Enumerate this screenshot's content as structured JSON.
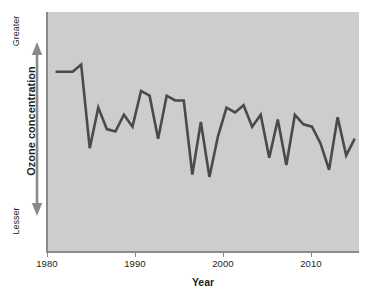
{
  "chart_data": {
    "type": "line",
    "title": "",
    "xlabel": "Year",
    "ylabel": "Ozone concentration",
    "y_axis_top_label": "Greater",
    "y_axis_bottom_label": "Lesser",
    "y_axis_tick_labels": [],
    "y_axis_has_numeric_ticks": false,
    "grid": false,
    "legend": null,
    "legend_position": "none",
    "xlim": [
      1979,
      2015.5
    ],
    "ylim": [
      0,
      100
    ],
    "x_tick_labels": [
      "1980",
      "1990",
      "2000",
      "2010"
    ],
    "x_ticks": [
      1980,
      1990,
      2000,
      2010
    ],
    "series": [
      {
        "name": "Ozone concentration",
        "x": [
          1980,
          1981,
          1982,
          1983,
          1984,
          1985,
          1986,
          1987,
          1988,
          1989,
          1990,
          1991,
          1992,
          1993,
          1994,
          1995,
          1996,
          1997,
          1998,
          1999,
          2000,
          2001,
          2002,
          2003,
          2004,
          2005,
          2006,
          2007,
          2008,
          2009,
          2010,
          2011,
          2012,
          2013,
          2014,
          2015
        ],
        "values": [
          75,
          75,
          75,
          78,
          43,
          60,
          51,
          50,
          57,
          52,
          67,
          65,
          47,
          65,
          63,
          63,
          32,
          54,
          31,
          48,
          60,
          58,
          61,
          52,
          57,
          39,
          55,
          36,
          57,
          53,
          52,
          45,
          34,
          56,
          40,
          47
        ]
      }
    ],
    "annotations": [],
    "colors": {
      "line": "#4a4a4a",
      "plot_background": "#cdcdcd",
      "figure_background": "#ffffff",
      "axis": "#8a8a8a",
      "text": "#231f20"
    }
  },
  "axes": {
    "x": {
      "title": "Year",
      "ticks": [
        {
          "label": "1980",
          "value": 1980
        },
        {
          "label": "1990",
          "value": 1990
        },
        {
          "label": "2000",
          "value": 2000
        },
        {
          "label": "2010",
          "value": 2010
        }
      ]
    },
    "y": {
      "title": "Ozone concentration",
      "top_label": "Greater",
      "bottom_label": "Lesser",
      "arrow_icon": "double-headed-vertical-arrow-icon"
    }
  }
}
